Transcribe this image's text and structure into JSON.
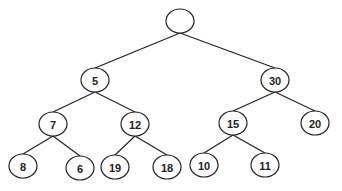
{
  "diagram": {
    "type": "binary-tree",
    "colors": {
      "stroke": "#222222",
      "fill": "#ffffff",
      "text": "#222222",
      "background": "#ffffff"
    },
    "node_size": {
      "rx": 14,
      "ry": 12
    },
    "nodes": [
      {
        "id": "root",
        "label": "",
        "x": 180,
        "y": 21
      },
      {
        "id": "n5",
        "label": "5",
        "x": 95,
        "y": 80
      },
      {
        "id": "n30",
        "label": "30",
        "x": 275,
        "y": 80
      },
      {
        "id": "n7",
        "label": "7",
        "x": 53,
        "y": 124
      },
      {
        "id": "n12",
        "label": "12",
        "x": 135,
        "y": 124
      },
      {
        "id": "n15",
        "label": "15",
        "x": 233,
        "y": 123
      },
      {
        "id": "n20",
        "label": "20",
        "x": 315,
        "y": 123
      },
      {
        "id": "n8",
        "label": "8",
        "x": 23,
        "y": 166
      },
      {
        "id": "n6",
        "label": "6",
        "x": 80,
        "y": 168
      },
      {
        "id": "n19",
        "label": "19",
        "x": 115,
        "y": 167
      },
      {
        "id": "n18",
        "label": "18",
        "x": 167,
        "y": 167
      },
      {
        "id": "n10",
        "label": "10",
        "x": 204,
        "y": 165
      },
      {
        "id": "n11",
        "label": "11",
        "x": 265,
        "y": 165
      }
    ],
    "edges": [
      {
        "from": "root",
        "to": "n5"
      },
      {
        "from": "root",
        "to": "n30"
      },
      {
        "from": "n5",
        "to": "n7"
      },
      {
        "from": "n5",
        "to": "n12"
      },
      {
        "from": "n30",
        "to": "n15"
      },
      {
        "from": "n30",
        "to": "n20"
      },
      {
        "from": "n7",
        "to": "n8"
      },
      {
        "from": "n7",
        "to": "n6"
      },
      {
        "from": "n12",
        "to": "n19"
      },
      {
        "from": "n12",
        "to": "n18"
      },
      {
        "from": "n15",
        "to": "n10"
      },
      {
        "from": "n15",
        "to": "n11"
      }
    ]
  }
}
